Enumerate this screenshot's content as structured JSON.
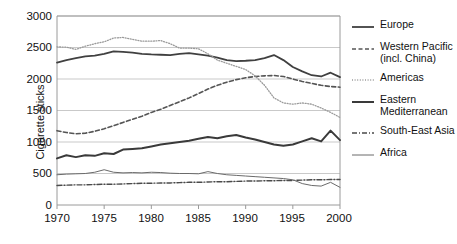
{
  "chart_data": {
    "type": "line",
    "title": "",
    "xlabel": "",
    "ylabel": "Cigarette sticks",
    "xlim": [
      1970,
      2000
    ],
    "ylim": [
      0,
      3000
    ],
    "yticks": [
      0,
      500,
      1000,
      1500,
      2000,
      2500,
      3000
    ],
    "xticks": [
      1970,
      1975,
      1980,
      1985,
      1990,
      1995,
      2000
    ],
    "grid": "horizontal",
    "legend_position": "right",
    "x": [
      1970,
      1971,
      1972,
      1973,
      1974,
      1975,
      1976,
      1977,
      1978,
      1979,
      1980,
      1981,
      1982,
      1983,
      1984,
      1985,
      1986,
      1987,
      1988,
      1989,
      1990,
      1991,
      1992,
      1993,
      1994,
      1995,
      1996,
      1997,
      1998,
      1999,
      2000
    ],
    "series": [
      {
        "name": "Europe",
        "style": "solid",
        "width": 1.8,
        "color": "#404040",
        "values": [
          2260,
          2300,
          2330,
          2360,
          2370,
          2400,
          2440,
          2430,
          2420,
          2400,
          2390,
          2385,
          2380,
          2400,
          2410,
          2390,
          2370,
          2340,
          2300,
          2285,
          2290,
          2300,
          2330,
          2380,
          2300,
          2190,
          2120,
          2060,
          2040,
          2100,
          2030
        ]
      },
      {
        "name": "Western Pacific (incl. China)",
        "style": "dashed",
        "width": 1.6,
        "color": "#555555",
        "values": [
          1180,
          1150,
          1130,
          1140,
          1170,
          1210,
          1260,
          1310,
          1360,
          1410,
          1470,
          1520,
          1580,
          1640,
          1700,
          1770,
          1840,
          1900,
          1950,
          1990,
          2020,
          2040,
          2050,
          2055,
          2040,
          2000,
          1960,
          1930,
          1900,
          1880,
          1870
        ]
      },
      {
        "name": "Americas",
        "style": "dotted",
        "width": 1.3,
        "color": "#9a9a9a",
        "values": [
          2510,
          2505,
          2470,
          2520,
          2560,
          2590,
          2650,
          2660,
          2630,
          2600,
          2600,
          2610,
          2560,
          2490,
          2490,
          2480,
          2400,
          2300,
          2250,
          2200,
          2150,
          2050,
          1900,
          1700,
          1620,
          1600,
          1620,
          1600,
          1540,
          1470,
          1390
        ]
      },
      {
        "name": "Eastern Mediterranean",
        "style": "solid",
        "width": 2.0,
        "color": "#3a3a3a",
        "values": [
          740,
          790,
          760,
          790,
          780,
          820,
          810,
          880,
          890,
          900,
          930,
          960,
          980,
          1000,
          1020,
          1050,
          1080,
          1060,
          1090,
          1110,
          1070,
          1040,
          1000,
          960,
          940,
          960,
          1010,
          1060,
          1010,
          1180,
          1030
        ]
      },
      {
        "name": "South-East Asia",
        "style": "dashdot",
        "width": 1.4,
        "color": "#4a4a4a",
        "values": [
          310,
          315,
          320,
          320,
          325,
          330,
          330,
          335,
          340,
          345,
          345,
          350,
          350,
          355,
          360,
          360,
          365,
          370,
          370,
          375,
          380,
          380,
          385,
          385,
          390,
          390,
          395,
          400,
          400,
          405,
          405
        ]
      },
      {
        "name": "Africa",
        "style": "solid",
        "width": 1.0,
        "color": "#6a6a6a",
        "values": [
          480,
          490,
          495,
          500,
          520,
          560,
          520,
          510,
          515,
          510,
          520,
          515,
          505,
          500,
          500,
          495,
          530,
          500,
          480,
          470,
          460,
          450,
          440,
          430,
          420,
          400,
          340,
          310,
          300,
          360,
          280
        ]
      }
    ]
  },
  "axis": {
    "ylabel": "Cigarette sticks",
    "yticks": [
      "3000",
      "2500",
      "2000",
      "1500",
      "1000",
      "500",
      "0"
    ],
    "xticks": [
      "1970",
      "1975",
      "1980",
      "1985",
      "1990",
      "1995",
      "2000"
    ]
  },
  "legend": {
    "items": [
      {
        "label": "Europe"
      },
      {
        "label": "Western Pacific"
      },
      {
        "label": "(incl. China)"
      },
      {
        "label": "Americas"
      },
      {
        "label": "Eastern"
      },
      {
        "label": "Mediterranean"
      },
      {
        "label": "South-East Asia"
      },
      {
        "label": "Africa"
      }
    ]
  }
}
